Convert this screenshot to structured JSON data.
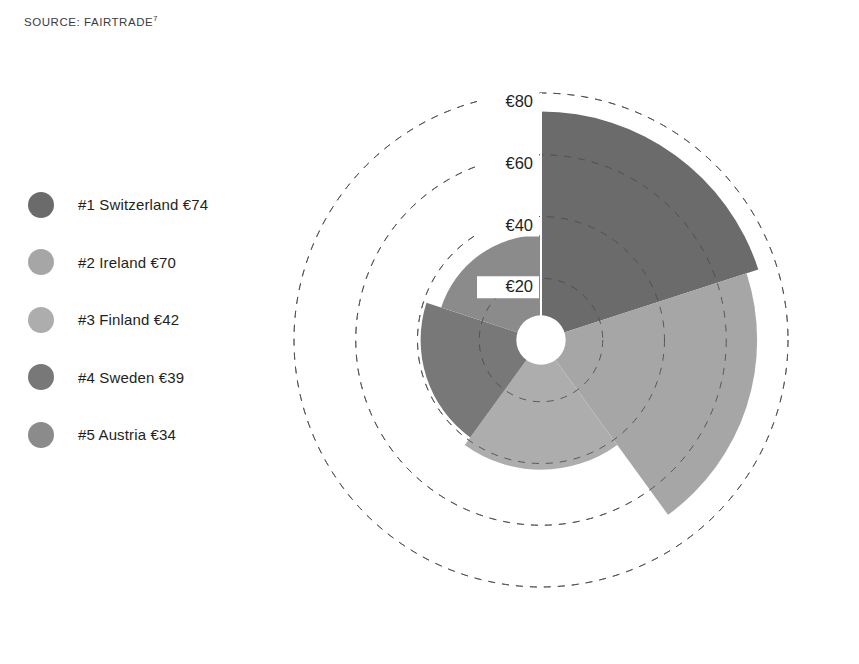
{
  "source": {
    "text": "SOURCE: FAIRTRADE",
    "superscript": "7"
  },
  "legend": {
    "items": [
      {
        "label": "#1 Switzerland €74",
        "color": "#6b6b6b"
      },
      {
        "label": "#2 Ireland €70",
        "color": "#a6a6a6"
      },
      {
        "label": "#3 Finland €42",
        "color": "#adadad"
      },
      {
        "label": "#4 Sweden €39",
        "color": "#787878"
      },
      {
        "label": "#5 Austria €34",
        "color": "#8b8b8b"
      }
    ]
  },
  "chart_data": {
    "type": "bar",
    "subtype": "polar-rose",
    "title": "",
    "subtitle": "",
    "xlabel": "",
    "ylabel": "",
    "categories": [
      "#1 Switzerland",
      "#2 Ireland",
      "#3 Finland",
      "#4 Sweden",
      "#5 Austria"
    ],
    "values": [
      74,
      70,
      42,
      39,
      34
    ],
    "value_labels": [
      "€74",
      "€70",
      "€42",
      "€39",
      "€34"
    ],
    "colors": [
      "#6b6b6b",
      "#a6a6a6",
      "#adadad",
      "#787878",
      "#8b8b8b"
    ],
    "unit": "€",
    "rlim": [
      0,
      80
    ],
    "r_ticks": [
      20,
      40,
      60,
      80
    ],
    "r_tick_labels": [
      "€20",
      "€40",
      "€60",
      "€80"
    ],
    "grid": true,
    "grid_style": "dashed",
    "grid_color": "#6f6f6f",
    "legend_position": "left",
    "start_angle_deg": 0,
    "direction": "clockwise",
    "sector_span_deg": 72,
    "inner_hole_radius_value": 8,
    "series": [
      {
        "name": "Average price paid per kg of Fairtrade coffee",
        "values": [
          74,
          70,
          42,
          39,
          34
        ]
      }
    ]
  }
}
